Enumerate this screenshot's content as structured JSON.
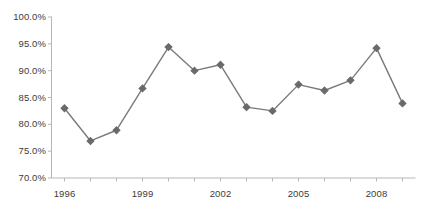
{
  "chart_data": {
    "type": "line",
    "title": "",
    "subtitle": "",
    "xlabel": "",
    "ylabel": "",
    "x": [
      1996,
      1997,
      1998,
      1999,
      2000,
      2001,
      2002,
      2003,
      2004,
      2005,
      2006,
      2007,
      2008,
      2009
    ],
    "values": [
      83.0,
      76.9,
      78.9,
      86.7,
      94.4,
      90.0,
      91.1,
      83.2,
      82.5,
      87.4,
      86.3,
      88.2,
      94.2,
      83.9
    ],
    "series": [
      {
        "name": "series-1",
        "values": [
          83.0,
          76.9,
          78.9,
          86.7,
          94.4,
          90.0,
          91.1,
          83.2,
          82.5,
          87.4,
          86.3,
          88.2,
          94.2,
          83.9
        ]
      }
    ],
    "ylim": [
      70.0,
      100.0
    ],
    "xlim": [
      1995.5,
      2009.5
    ],
    "ytick_values": [
      70.0,
      75.0,
      80.0,
      85.0,
      90.0,
      95.0,
      100.0
    ],
    "ytick_labels": [
      "70.0%",
      "75.0%",
      "80.0%",
      "85.0%",
      "90.0%",
      "95.0%",
      "100.0%"
    ],
    "xtick_values": [
      1996,
      1997,
      1998,
      1999,
      2000,
      2001,
      2002,
      2003,
      2004,
      2005,
      2006,
      2007,
      2008,
      2009
    ],
    "xtick_labels": [
      "1996",
      "",
      "",
      "1999",
      "",
      "",
      "2002",
      "",
      "",
      "2005",
      "",
      "",
      "2008",
      ""
    ],
    "visible_xtick_labels": [
      "1996",
      "1999",
      "2002",
      "2005",
      "2008"
    ],
    "grid": false,
    "legend": false,
    "legend_position": "none",
    "marker": "diamond",
    "line_color": "#7a7a7a",
    "marker_color": "#6a6a6a",
    "axis_color": "#b7b7b7",
    "text_color": "#3b3b3b",
    "background_color": "#ffffff",
    "annotations": []
  }
}
